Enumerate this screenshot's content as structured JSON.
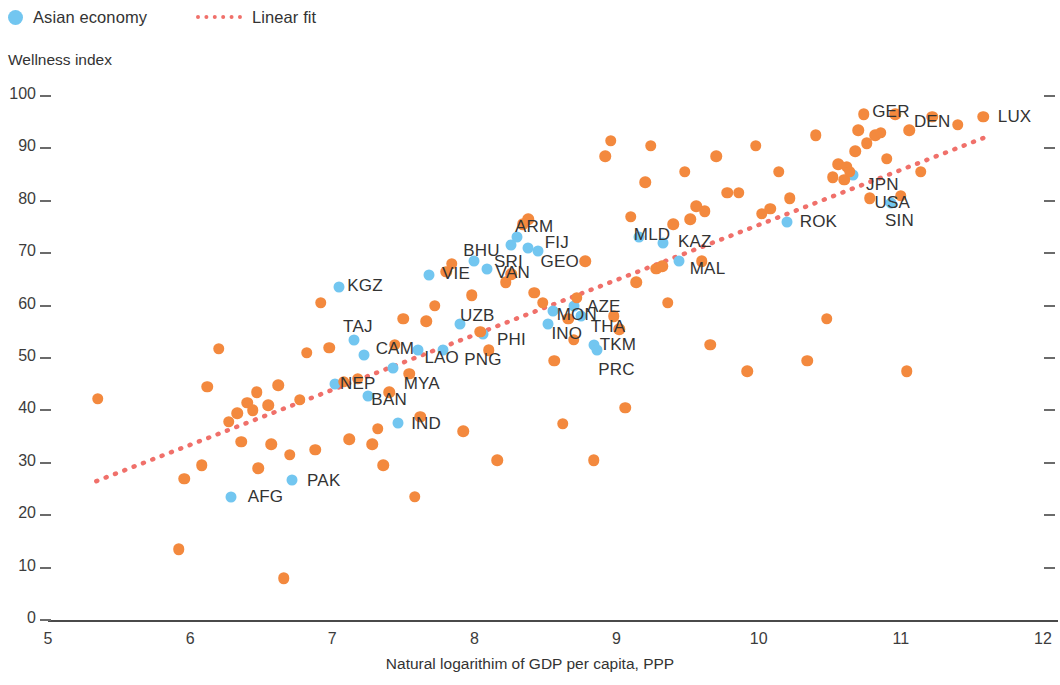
{
  "legend": {
    "items": [
      {
        "label": "Asian economy",
        "marker": "circle",
        "color": "#72c6f0",
        "name": "legend-asian-economy"
      },
      {
        "label": "Linear fit",
        "marker": "dotted-line",
        "color": "#f0706a",
        "name": "legend-linear-fit"
      }
    ]
  },
  "axes": {
    "y_title": "Wellness index",
    "x_title": "Natural logarithim of GDP per capita, PPP"
  },
  "colors": {
    "asian": "#72c6f0",
    "other": "#f3893e",
    "fit": "#f0706a",
    "axis": "#4a4a4a",
    "text": "#333333"
  },
  "chart_data": {
    "type": "scatter",
    "title": "",
    "xlabel": "Natural logarithim of GDP per capita, PPP",
    "ylabel": "Wellness index",
    "xlim": [
      5,
      12
    ],
    "ylim": [
      0,
      100
    ],
    "xticks": [
      5,
      6,
      7,
      8,
      9,
      10,
      11,
      12
    ],
    "yticks": [
      0,
      10,
      20,
      30,
      40,
      50,
      60,
      70,
      80,
      90,
      100
    ],
    "grid": false,
    "legend_position": "top-left",
    "series": [
      {
        "name": "Asian economy",
        "color": "#72c6f0",
        "points": [
          {
            "label": "AFG",
            "x": 6.29,
            "y": 23.5
          },
          {
            "label": "PAK",
            "x": 6.72,
            "y": 26.8
          },
          {
            "label": "BAN",
            "x": 7.25,
            "y": 42.8
          },
          {
            "label": "NEP",
            "x": 7.02,
            "y": 45.0
          },
          {
            "label": "IND",
            "x": 7.46,
            "y": 37.6
          },
          {
            "label": "TAJ",
            "x": 7.15,
            "y": 53.5
          },
          {
            "label": "KGZ",
            "x": 7.05,
            "y": 63.5
          },
          {
            "label": "CAM",
            "x": 7.22,
            "y": 50.5
          },
          {
            "label": "MYA",
            "x": 7.43,
            "y": 48.0
          },
          {
            "label": "LAO",
            "x": 7.6,
            "y": 51.5
          },
          {
            "label": "VIE",
            "x": 7.68,
            "y": 65.8
          },
          {
            "label": "PNG",
            "x": 7.78,
            "y": 51.5
          },
          {
            "label": "UZB",
            "x": 7.9,
            "y": 56.5
          },
          {
            "label": "PHI",
            "x": 8.06,
            "y": 54.5
          },
          {
            "label": "BHU",
            "x": 8.0,
            "y": 68.5
          },
          {
            "label": "VAN",
            "x": 8.09,
            "y": 67.0
          },
          {
            "label": "SRI",
            "x": 8.26,
            "y": 71.5
          },
          {
            "label": "ARM",
            "x": 8.3,
            "y": 73.0
          },
          {
            "label": "FIJ",
            "x": 8.38,
            "y": 71.0
          },
          {
            "label": "GEO",
            "x": 8.45,
            "y": 70.5
          },
          {
            "label": "MON",
            "x": 8.55,
            "y": 59.0
          },
          {
            "label": "INO",
            "x": 8.52,
            "y": 56.5
          },
          {
            "label": "AZE",
            "x": 8.7,
            "y": 60.0
          },
          {
            "label": "THA",
            "x": 8.75,
            "y": 58.0
          },
          {
            "label": "TKM",
            "x": 8.84,
            "y": 52.5
          },
          {
            "label": "PRC",
            "x": 8.86,
            "y": 51.5
          },
          {
            "label": "MLD",
            "x": 9.16,
            "y": 73.0
          },
          {
            "label": "KAZ",
            "x": 9.33,
            "y": 72.0
          },
          {
            "label": "MAL",
            "x": 9.44,
            "y": 68.5
          },
          {
            "label": "ROK",
            "x": 10.2,
            "y": 76.0
          },
          {
            "label": "JPN",
            "x": 10.66,
            "y": 85.0
          },
          {
            "label": "SIN",
            "x": 10.93,
            "y": 79.5
          }
        ]
      },
      {
        "name": "Other economy",
        "color": "#f3893e",
        "points": [
          {
            "label": "",
            "x": 5.35,
            "y": 42.2
          },
          {
            "label": "",
            "x": 5.92,
            "y": 13.5
          },
          {
            "label": "",
            "x": 5.96,
            "y": 27.0
          },
          {
            "label": "",
            "x": 6.08,
            "y": 29.5
          },
          {
            "label": "",
            "x": 6.12,
            "y": 44.5
          },
          {
            "label": "",
            "x": 6.2,
            "y": 51.8
          },
          {
            "label": "",
            "x": 6.27,
            "y": 37.8
          },
          {
            "label": "",
            "x": 6.33,
            "y": 39.5
          },
          {
            "label": "",
            "x": 6.36,
            "y": 34.0
          },
          {
            "label": "",
            "x": 6.4,
            "y": 41.5
          },
          {
            "label": "",
            "x": 6.44,
            "y": 40.0
          },
          {
            "label": "",
            "x": 6.47,
            "y": 43.5
          },
          {
            "label": "",
            "x": 6.48,
            "y": 29.0
          },
          {
            "label": "",
            "x": 6.55,
            "y": 41.0
          },
          {
            "label": "",
            "x": 6.57,
            "y": 33.5
          },
          {
            "label": "",
            "x": 6.62,
            "y": 44.8
          },
          {
            "label": "",
            "x": 6.66,
            "y": 8.0
          },
          {
            "label": "",
            "x": 6.7,
            "y": 31.5
          },
          {
            "label": "",
            "x": 6.77,
            "y": 42.0
          },
          {
            "label": "",
            "x": 6.82,
            "y": 51.0
          },
          {
            "label": "",
            "x": 6.88,
            "y": 32.5
          },
          {
            "label": "",
            "x": 6.92,
            "y": 60.5
          },
          {
            "label": "",
            "x": 6.98,
            "y": 52.0
          },
          {
            "label": "",
            "x": 7.08,
            "y": 45.5
          },
          {
            "label": "",
            "x": 7.12,
            "y": 34.5
          },
          {
            "label": "",
            "x": 7.18,
            "y": 46.0
          },
          {
            "label": "",
            "x": 7.28,
            "y": 33.5
          },
          {
            "label": "",
            "x": 7.32,
            "y": 36.5
          },
          {
            "label": "",
            "x": 7.36,
            "y": 29.5
          },
          {
            "label": "",
            "x": 7.4,
            "y": 43.5
          },
          {
            "label": "",
            "x": 7.44,
            "y": 52.5
          },
          {
            "label": "",
            "x": 7.5,
            "y": 57.5
          },
          {
            "label": "",
            "x": 7.54,
            "y": 47.0
          },
          {
            "label": "",
            "x": 7.58,
            "y": 23.5
          },
          {
            "label": "",
            "x": 7.62,
            "y": 38.8
          },
          {
            "label": "",
            "x": 7.66,
            "y": 57.0
          },
          {
            "label": "",
            "x": 7.72,
            "y": 60.0
          },
          {
            "label": "",
            "x": 7.8,
            "y": 66.5
          },
          {
            "label": "",
            "x": 7.84,
            "y": 68.0
          },
          {
            "label": "",
            "x": 7.92,
            "y": 36.0
          },
          {
            "label": "",
            "x": 7.98,
            "y": 62.0
          },
          {
            "label": "",
            "x": 8.04,
            "y": 55.0
          },
          {
            "label": "",
            "x": 8.1,
            "y": 51.5
          },
          {
            "label": "",
            "x": 8.16,
            "y": 30.5
          },
          {
            "label": "",
            "x": 8.22,
            "y": 64.5
          },
          {
            "label": "",
            "x": 8.26,
            "y": 66.0
          },
          {
            "label": "",
            "x": 8.34,
            "y": 75.5
          },
          {
            "label": "",
            "x": 8.38,
            "y": 76.5
          },
          {
            "label": "",
            "x": 8.42,
            "y": 62.5
          },
          {
            "label": "",
            "x": 8.48,
            "y": 60.5
          },
          {
            "label": "",
            "x": 8.56,
            "y": 49.5
          },
          {
            "label": "",
            "x": 8.62,
            "y": 37.5
          },
          {
            "label": "",
            "x": 8.66,
            "y": 57.5
          },
          {
            "label": "",
            "x": 8.7,
            "y": 53.5
          },
          {
            "label": "",
            "x": 8.72,
            "y": 61.5
          },
          {
            "label": "",
            "x": 8.78,
            "y": 68.5
          },
          {
            "label": "",
            "x": 8.84,
            "y": 30.5
          },
          {
            "label": "",
            "x": 8.92,
            "y": 88.5
          },
          {
            "label": "",
            "x": 8.96,
            "y": 91.5
          },
          {
            "label": "",
            "x": 8.98,
            "y": 58.0
          },
          {
            "label": "",
            "x": 9.02,
            "y": 55.5
          },
          {
            "label": "",
            "x": 9.06,
            "y": 40.5
          },
          {
            "label": "",
            "x": 9.1,
            "y": 77.0
          },
          {
            "label": "",
            "x": 9.14,
            "y": 64.5
          },
          {
            "label": "",
            "x": 9.2,
            "y": 83.5
          },
          {
            "label": "",
            "x": 9.24,
            "y": 90.5
          },
          {
            "label": "",
            "x": 9.28,
            "y": 67.0
          },
          {
            "label": "",
            "x": 9.32,
            "y": 67.5
          },
          {
            "label": "",
            "x": 9.36,
            "y": 60.5
          },
          {
            "label": "",
            "x": 9.4,
            "y": 75.5
          },
          {
            "label": "",
            "x": 9.48,
            "y": 85.5
          },
          {
            "label": "",
            "x": 9.52,
            "y": 76.5
          },
          {
            "label": "",
            "x": 9.56,
            "y": 79.0
          },
          {
            "label": "",
            "x": 9.6,
            "y": 68.5
          },
          {
            "label": "",
            "x": 9.62,
            "y": 78.0
          },
          {
            "label": "",
            "x": 9.66,
            "y": 52.5
          },
          {
            "label": "",
            "x": 9.7,
            "y": 88.5
          },
          {
            "label": "",
            "x": 9.78,
            "y": 81.5
          },
          {
            "label": "",
            "x": 9.86,
            "y": 81.5
          },
          {
            "label": "",
            "x": 9.92,
            "y": 47.5
          },
          {
            "label": "",
            "x": 9.98,
            "y": 90.5
          },
          {
            "label": "",
            "x": 10.02,
            "y": 77.5
          },
          {
            "label": "",
            "x": 10.08,
            "y": 78.5
          },
          {
            "label": "",
            "x": 10.14,
            "y": 85.5
          },
          {
            "label": "",
            "x": 10.22,
            "y": 80.5
          },
          {
            "label": "",
            "x": 10.34,
            "y": 49.5
          },
          {
            "label": "",
            "x": 10.4,
            "y": 92.5
          },
          {
            "label": "",
            "x": 10.48,
            "y": 57.5
          },
          {
            "label": "",
            "x": 10.52,
            "y": 84.5
          },
          {
            "label": "",
            "x": 10.56,
            "y": 87.0
          },
          {
            "label": "",
            "x": 10.6,
            "y": 84.0
          },
          {
            "label": "",
            "x": 10.62,
            "y": 86.5
          },
          {
            "label": "",
            "x": 10.64,
            "y": 85.5
          },
          {
            "label": "",
            "x": 10.68,
            "y": 89.5
          },
          {
            "label": "",
            "x": 10.7,
            "y": 93.5
          },
          {
            "label": "",
            "x": 10.74,
            "y": 96.5
          },
          {
            "label": "",
            "x": 10.76,
            "y": 91.0
          },
          {
            "label": "",
            "x": 10.78,
            "y": 80.5
          },
          {
            "label": "",
            "x": 10.82,
            "y": 92.5
          },
          {
            "label": "",
            "x": 10.86,
            "y": 93.0
          },
          {
            "label": "",
            "x": 10.9,
            "y": 88.0
          },
          {
            "label": "",
            "x": 10.96,
            "y": 96.5
          },
          {
            "label": "",
            "x": 11.0,
            "y": 81.0
          },
          {
            "label": "",
            "x": 11.04,
            "y": 47.5
          },
          {
            "label": "",
            "x": 11.06,
            "y": 93.5
          },
          {
            "label": "",
            "x": 11.14,
            "y": 85.5
          },
          {
            "label": "",
            "x": 11.22,
            "y": 96.0
          },
          {
            "label": "",
            "x": 11.4,
            "y": 94.5
          },
          {
            "label": "",
            "x": 11.58,
            "y": 96.0
          }
        ]
      }
    ],
    "linear_fit": {
      "name": "Linear fit",
      "color": "#f0706a",
      "style": "dotted",
      "x_start": 5.34,
      "y_start": 26.5,
      "x_end": 11.63,
      "y_end": 92.5
    },
    "annotations": [
      {
        "text": "KGZ",
        "x": 7.23,
        "y": 63.8
      },
      {
        "text": "VIE",
        "x": 7.87,
        "y": 66.0
      },
      {
        "text": "BHU",
        "x": 8.05,
        "y": 70.5
      },
      {
        "text": "SRI",
        "x": 8.24,
        "y": 68.4
      },
      {
        "text": "ARM",
        "x": 8.42,
        "y": 75.0
      },
      {
        "text": "FIJ",
        "x": 8.58,
        "y": 72.0
      },
      {
        "text": "GEO",
        "x": 8.6,
        "y": 68.4
      },
      {
        "text": "VAN",
        "x": 8.27,
        "y": 66.2
      },
      {
        "text": "MLD",
        "x": 9.25,
        "y": 73.5
      },
      {
        "text": "KAZ",
        "x": 9.55,
        "y": 72.2
      },
      {
        "text": "MAL",
        "x": 9.64,
        "y": 67.0
      },
      {
        "text": "ROK",
        "x": 10.42,
        "y": 76.0
      },
      {
        "text": "JPN",
        "x": 10.87,
        "y": 83.0
      },
      {
        "text": "USA",
        "x": 10.94,
        "y": 79.5
      },
      {
        "text": "SIN",
        "x": 10.99,
        "y": 76.2
      },
      {
        "text": "GER",
        "x": 10.93,
        "y": 97.0
      },
      {
        "text": "DEN",
        "x": 11.22,
        "y": 95.0
      },
      {
        "text": "LUX",
        "x": 11.8,
        "y": 96.0
      },
      {
        "text": "TAJ",
        "x": 7.18,
        "y": 56.0
      },
      {
        "text": "CAM",
        "x": 7.44,
        "y": 51.8
      },
      {
        "text": "LAO",
        "x": 7.77,
        "y": 50.0
      },
      {
        "text": "UZB",
        "x": 8.02,
        "y": 58.0
      },
      {
        "text": "PHI",
        "x": 8.26,
        "y": 53.5
      },
      {
        "text": "PNG",
        "x": 8.06,
        "y": 49.6
      },
      {
        "text": "MON",
        "x": 8.72,
        "y": 58.2
      },
      {
        "text": "AZE",
        "x": 8.91,
        "y": 59.8
      },
      {
        "text": "INO",
        "x": 8.65,
        "y": 54.5
      },
      {
        "text": "THA",
        "x": 8.94,
        "y": 56.0
      },
      {
        "text": "TKM",
        "x": 9.01,
        "y": 52.5
      },
      {
        "text": "PRC",
        "x": 9.0,
        "y": 47.8
      },
      {
        "text": "NEP",
        "x": 7.18,
        "y": 45.0
      },
      {
        "text": "MYA",
        "x": 7.63,
        "y": 45.0
      },
      {
        "text": "BAN",
        "x": 7.4,
        "y": 42.0
      },
      {
        "text": "IND",
        "x": 7.66,
        "y": 37.5
      },
      {
        "text": "AFG",
        "x": 6.53,
        "y": 23.5
      },
      {
        "text": "PAK",
        "x": 6.94,
        "y": 26.5
      }
    ]
  }
}
